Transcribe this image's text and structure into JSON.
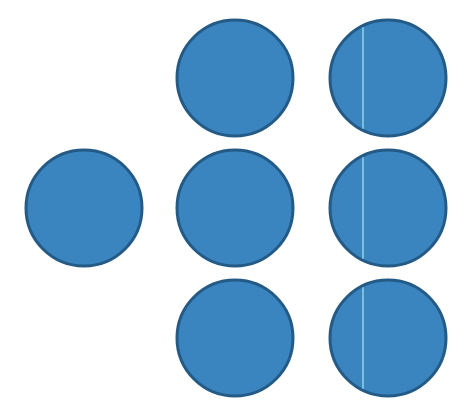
{
  "colors": {
    "fill": "#3a85c0",
    "stroke": "#245a86",
    "divider": "#a8e6e8",
    "background": "#ffffff"
  },
  "circles": [
    {
      "id": "left-single",
      "cx": 84,
      "cy": 208,
      "r": 58,
      "divided": false
    },
    {
      "id": "col2-top",
      "cx": 235,
      "cy": 78,
      "r": 58,
      "divided": false
    },
    {
      "id": "col2-middle",
      "cx": 235,
      "cy": 208,
      "r": 58,
      "divided": false
    },
    {
      "id": "col2-bottom",
      "cx": 235,
      "cy": 338,
      "r": 58,
      "divided": false
    },
    {
      "id": "col3-top",
      "cx": 388,
      "cy": 78,
      "r": 58,
      "divided": true,
      "divider_x": 363
    },
    {
      "id": "col3-middle",
      "cx": 388,
      "cy": 208,
      "r": 58,
      "divided": true,
      "divider_x": 363
    },
    {
      "id": "col3-bottom",
      "cx": 388,
      "cy": 338,
      "r": 58,
      "divided": true,
      "divider_x": 363
    }
  ]
}
